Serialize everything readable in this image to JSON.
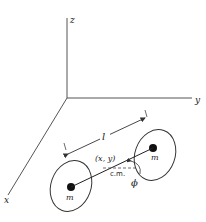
{
  "diagram": {
    "type": "rigid-dumbbell-rotor-3d-axes",
    "axes": {
      "x_label": "x",
      "y_label": "y",
      "z_label": "z"
    },
    "masses": [
      {
        "label": "m"
      },
      {
        "label": "m"
      }
    ],
    "length_label": "l",
    "center_label": "(x, y)",
    "cm_label": "c.m.",
    "angle_label": "ϕ",
    "colors": {
      "stroke": "#333333",
      "background": "#ffffff"
    }
  }
}
